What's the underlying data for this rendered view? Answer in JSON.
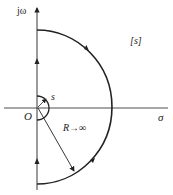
{
  "diagram": {
    "labels": {
      "imag_axis": "jω",
      "real_axis": "σ",
      "origin": "O",
      "plane": "[s]",
      "small_radius": "s",
      "radius": "R→∞"
    },
    "colors": {
      "stroke": "#222222",
      "background": "#ffffff"
    }
  }
}
